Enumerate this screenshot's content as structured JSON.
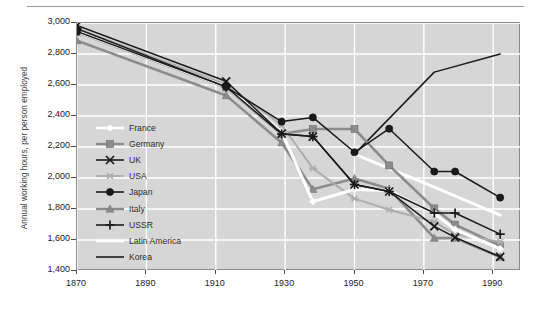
{
  "chart_data": {
    "type": "line",
    "title": "",
    "xlabel": "",
    "ylabel": "Annual working hours, per person employed",
    "xlim": [
      1870,
      1998
    ],
    "ylim": [
      1400,
      3000
    ],
    "xticks": [
      "1870",
      "1890",
      "1910",
      "1930",
      "1950",
      "1970",
      "1990"
    ],
    "xtick_values": [
      1870,
      1890,
      1910,
      1930,
      1950,
      1970,
      1990
    ],
    "yticks": [
      "1,400",
      "1,600",
      "1,800",
      "2,000",
      "2,200",
      "2,400",
      "2,600",
      "2,800",
      "3,000"
    ],
    "ytick_values": [
      1400,
      1600,
      1800,
      2000,
      2200,
      2400,
      2600,
      2800,
      3000
    ],
    "grid": true,
    "grid_color": "#ffffff",
    "plot_background": "#d6d6d6",
    "legend_position": "center-left",
    "series": [
      {
        "name": "France",
        "color": "#ffffff",
        "marker": "diamond",
        "x": [
          1870,
          1913,
          1929,
          1938,
          1950,
          1960,
          1973,
          1979,
          1992
        ],
        "y": [
          2945,
          2588,
          2297,
          1848,
          1926,
          1919,
          1771,
          1667,
          1542
        ]
      },
      {
        "name": "Germany",
        "color": "#8c8c8c",
        "marker": "square",
        "x": [
          1870,
          1913,
          1929,
          1938,
          1950,
          1960,
          1973,
          1979,
          1992
        ],
        "y": [
          2941,
          2584,
          2284,
          2316,
          2316,
          2081,
          1804,
          1699,
          1563
        ]
      },
      {
        "name": "UK",
        "color": "#1a1a1a",
        "marker": "x",
        "x": [
          1870,
          1913,
          1929,
          1938,
          1950,
          1960,
          1973,
          1979,
          1992
        ],
        "y": [
          2984,
          2624,
          2286,
          2267,
          1958,
          1913,
          1688,
          1617,
          1491
        ]
      },
      {
        "name": "USA",
        "color": "#adadad",
        "marker": "asterisk",
        "x": [
          1870,
          1913,
          1929,
          1938,
          1950,
          1960,
          1973,
          1979,
          1992
        ],
        "y": [
          2964,
          2605,
          2342,
          2062,
          1867,
          1795,
          1717,
          1637,
          1589
        ]
      },
      {
        "name": "Japan",
        "color": "#1a1a1a",
        "marker": "circle",
        "x": [
          1870,
          1913,
          1929,
          1938,
          1950,
          1960,
          1973,
          1979,
          1992
        ],
        "y": [
          2945,
          2588,
          2364,
          2391,
          2166,
          2318,
          2042,
          2042,
          1874
        ]
      },
      {
        "name": "Italy",
        "color": "#8c8c8c",
        "marker": "triangle",
        "x": [
          1870,
          1913,
          1929,
          1938,
          1950,
          1960,
          1973,
          1979,
          1992
        ],
        "y": [
          2886,
          2532,
          2228,
          1927,
          1997,
          1930,
          1612,
          1612,
          1490
        ]
      },
      {
        "name": "USSR",
        "color": "#1a1a1a",
        "marker": "plus",
        "x": [
          1870,
          1913,
          1929,
          1938,
          1950,
          1960,
          1973,
          1979,
          1992
        ],
        "y": [
          2964,
          2588,
          2284,
          2267,
          1958,
          1913,
          1774,
          1774,
          1638
        ]
      },
      {
        "name": "Latin America",
        "color": "#ffffff",
        "marker": "none",
        "x": [
          1950,
          1973,
          1992
        ],
        "y": [
          2154,
          1941,
          1761
        ]
      },
      {
        "name": "Korea",
        "color": "#1a1a1a",
        "marker": "none",
        "x": [
          1950,
          1973,
          1992
        ],
        "y": [
          2154,
          2683,
          2800
        ]
      }
    ]
  },
  "legend": {
    "items": [
      {
        "label": "France"
      },
      {
        "label": "Germany"
      },
      {
        "label": "UK"
      },
      {
        "label": "USA"
      },
      {
        "label": "Japan"
      },
      {
        "label": "Italy"
      },
      {
        "label": "USSR"
      },
      {
        "label": "Latin America"
      },
      {
        "label": "Korea"
      }
    ]
  }
}
